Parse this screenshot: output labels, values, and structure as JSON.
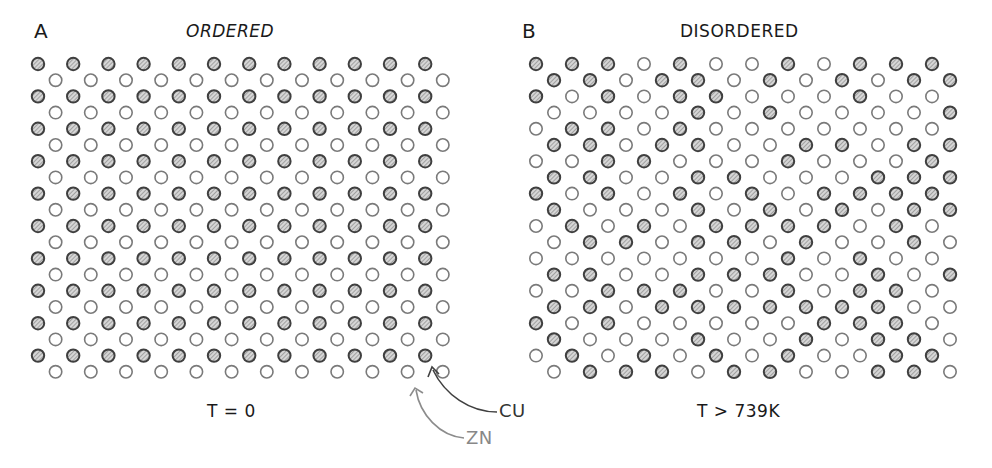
{
  "panels": [
    {
      "letter": "A",
      "title": "ORDERED",
      "temperature": "T = 0",
      "origin_x": 38,
      "origin_y": 64,
      "col_spacing": 35.2,
      "row_spacing": 16.2,
      "rows": [
        "FFFFFFFFFFFF",
        "EEEEEEEEEEEE",
        "FFFFFFFFFFFF",
        "EEEEEEEEEEEE",
        "FFFFFFFFFFFF",
        "EEEEEEEEEEEE",
        "FFFFFFFFFFFF",
        "EEEEEEEEEEEE",
        "FFFFFFFFFFFF",
        "EEEEEEEEEEEE",
        "FFFFFFFFFFFF",
        "EEEEEEEEEEEE",
        "FFFFFFFFFFFF",
        "EEEEEEEEEEEE",
        "FFFFFFFFFFFF",
        "EEEEEEEEEEEE",
        "FFFFFFFFFFFF",
        "EEEEEEEEEEEE",
        "FFFFFFFFFFFF",
        "EEEEEEEEEEEE"
      ]
    },
    {
      "letter": "B",
      "title": "DISORDERED",
      "temperature": "T > 739K",
      "origin_x": 536,
      "origin_y": 64,
      "col_spacing": 36.0,
      "row_spacing": 16.2,
      "rows": [
        "FFFEFEEFEFFF",
        "FFEFFEFEFEFF",
        "FEFEFFEEEFEE",
        "EEEEFEFEEEEF",
        "EFFEFEEEEEEE",
        "FFEFFEEFFEFF",
        "EEFFEEEFEEEF",
        "FFEEFFEEEFFF",
        "FEFEFEFEFFFF",
        "FEEEFEFEFEFF",
        "EFEFEFFFFEFE",
        "EFFEFFEFEEFE",
        "EEEEEEEFEFEE",
        "FFEEFFFEEFEF",
        "EEFFFEEFEFFE",
        "FFEFFFFFFFEE",
        "FEFEEEEEFFFE",
        "FEEEFEEFEFFE",
        "EFEFEFEFEEFF",
        "EFFFEFFEEFFE"
      ]
    }
  ],
  "legend": {
    "cu_label": "CU",
    "zn_label": "ZN"
  },
  "colors": {
    "cu_stroke": "#3f3f3f",
    "cu_hatch": "#8a8a8a",
    "cu_fill": "#d6d6d6",
    "zn_stroke": "#7a7a7a",
    "text": "#1a1a1a",
    "cu_arrow": "#404040",
    "zn_arrow": "#8c8c8c"
  }
}
